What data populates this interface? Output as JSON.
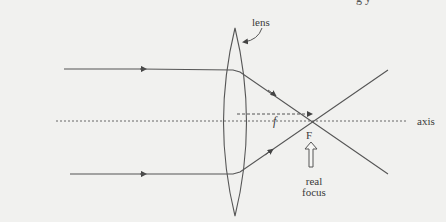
{
  "diagram": {
    "type": "optics-ray-diagram",
    "title_fragment": "g y",
    "labels": {
      "lens": "lens",
      "focal_length": "f",
      "focus_point": "F",
      "axis": "axis",
      "real_focus_line1": "real",
      "real_focus_line2": "focus"
    },
    "elements": {
      "lens": {
        "kind": "converging (biconvex) lens",
        "center_x": 235,
        "top_y": 28,
        "bottom_y": 216
      },
      "principal_axis": {
        "y": 121,
        "style": "dotted"
      },
      "incoming_rays": [
        {
          "name": "upper-ray",
          "y": 69,
          "direction": "right"
        },
        {
          "name": "lower-ray",
          "y": 174,
          "direction": "right"
        }
      ],
      "focus": {
        "x": 311,
        "y": 123
      },
      "focal_length_indicator": {
        "style": "dashed arrow",
        "y": 114
      }
    },
    "colors": {
      "background": "#f1f1ef",
      "line": "#555555",
      "text": "#3a3a3a"
    }
  }
}
